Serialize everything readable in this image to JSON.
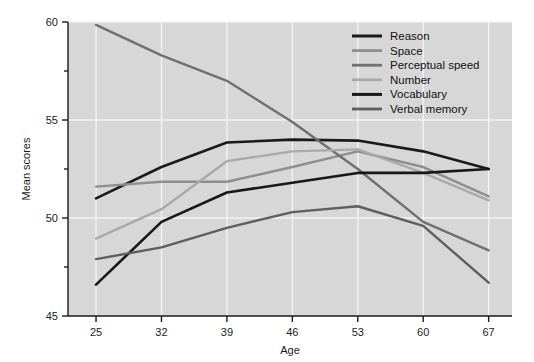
{
  "figure": {
    "background": "#ffffff",
    "plot_background": "#d7d7d7",
    "grid_color": "#f2f2f2",
    "axis_color": "#1b1b1b"
  },
  "chart_data": {
    "type": "line",
    "title": "",
    "subtitle": "",
    "xlabel": "Age",
    "ylabel": "Mean scores",
    "categories": [
      25,
      32,
      39,
      46,
      53,
      60,
      67
    ],
    "x": [
      25,
      32,
      39,
      46,
      53,
      60,
      67
    ],
    "xtick_labels": [
      "25",
      "32",
      "39",
      "46",
      "53",
      "60",
      "67"
    ],
    "ytick_labels": [
      "45",
      "50",
      "55",
      "60"
    ],
    "yticks": [
      45,
      50,
      55,
      60
    ],
    "yticks_minor": [
      47.5,
      52.5,
      57.5
    ],
    "xlim": [
      22.0,
      69.5
    ],
    "ylim": [
      45,
      60
    ],
    "grid": true,
    "legend_position": "upper right (inside plot area)",
    "series": [
      {
        "name": "Reason",
        "color": "#1a1a1a",
        "width": 2.6,
        "values": [
          51.0,
          52.6,
          53.85,
          54.0,
          53.95,
          53.4,
          52.5
        ]
      },
      {
        "name": "Space",
        "color": "#8e8e8e",
        "width": 2.4,
        "values": [
          51.6,
          51.85,
          51.85,
          52.6,
          53.4,
          52.6,
          51.1
        ]
      },
      {
        "name": "Perceptual speed",
        "color": "#6f6f6f",
        "width": 2.4,
        "values": [
          59.85,
          58.3,
          57.0,
          54.9,
          52.5,
          49.8,
          48.35
        ]
      },
      {
        "name": "Number",
        "color": "#a9a9a9",
        "width": 2.4,
        "values": [
          48.95,
          50.45,
          52.9,
          53.4,
          53.5,
          52.3,
          50.9
        ]
      },
      {
        "name": "Vocabulary",
        "color": "#171717",
        "width": 2.6,
        "values": [
          46.6,
          49.8,
          51.3,
          51.8,
          52.3,
          52.3,
          52.5
        ]
      },
      {
        "name": "Verbal memory",
        "color": "#5e5e5e",
        "width": 2.4,
        "values": [
          47.9,
          48.5,
          49.5,
          50.3,
          50.6,
          49.6,
          46.7
        ]
      }
    ]
  }
}
